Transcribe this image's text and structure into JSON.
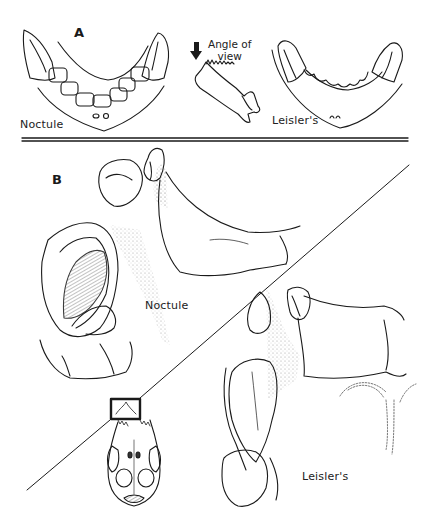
{
  "figure": {
    "panels": [
      {
        "id": "A",
        "letter": "A",
        "description": "Lower jaws viewed from above, comparing dentition",
        "labels": {
          "left_species": "Noctule",
          "right_species": "Leisler's",
          "angle_caption_line1": "Angle of",
          "angle_caption_line2": "view"
        },
        "icons": [
          "down-arrow-icon"
        ]
      },
      {
        "id": "B",
        "letter": "B",
        "description": "Close-up of upper canine and incisor region",
        "labels": {
          "upper_species": "Noctule",
          "lower_species": "Leisler's"
        },
        "inset": "skull-ventral-view-with-highlight-box"
      }
    ],
    "colors": {
      "ink": "#1a1a1a",
      "stipple": "#8a8a8a",
      "background": "#ffffff"
    }
  }
}
